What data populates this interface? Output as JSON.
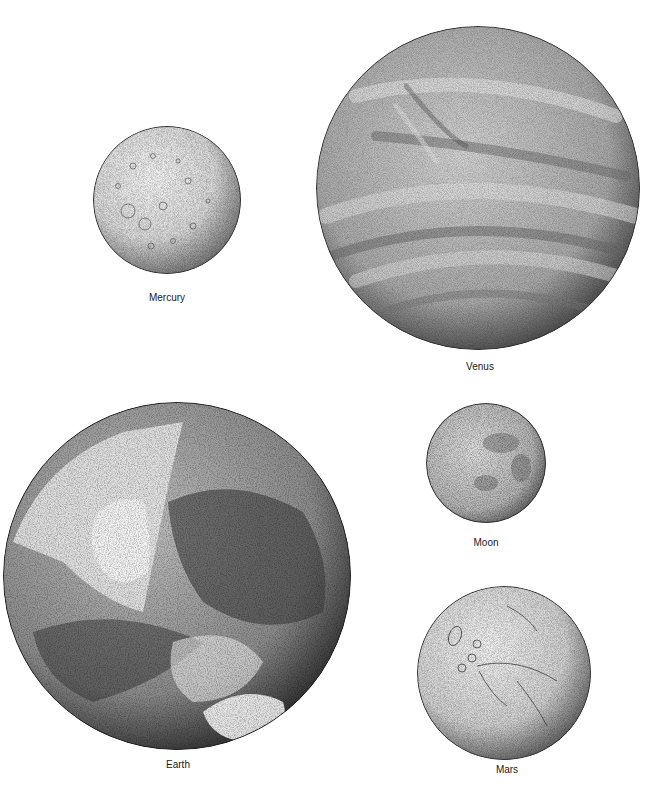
{
  "figure": {
    "planets": [
      {
        "name": "Mercury",
        "cx": 167,
        "cy": 200,
        "r": 74,
        "label_x": 167,
        "label_y": 292
      },
      {
        "name": "Venus",
        "cx": 478,
        "cy": 188,
        "r": 162,
        "label_x": 480,
        "label_y": 361
      },
      {
        "name": "Earth",
        "cx": 177,
        "cy": 576,
        "r": 174,
        "label_x": 178,
        "label_y": 759
      },
      {
        "name": "Moon",
        "cx": 486,
        "cy": 463,
        "r": 60,
        "label_x": 486,
        "label_y": 537
      },
      {
        "name": "Mars",
        "cx": 504,
        "cy": 673,
        "r": 87,
        "label_x": 507,
        "label_y": 764
      }
    ],
    "colors": {
      "background": "#ffffff",
      "ink": "#1a1a1a"
    }
  }
}
